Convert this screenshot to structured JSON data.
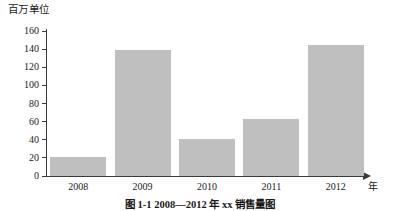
{
  "chart_data": {
    "type": "bar",
    "title": "",
    "categories": [
      "2008",
      "2009",
      "2010",
      "2011",
      "2012"
    ],
    "values": [
      21,
      139,
      41,
      63,
      145
    ],
    "series": [
      {
        "name": "销售量",
        "values": [
          21,
          139,
          41,
          63,
          145
        ]
      }
    ],
    "xlabel": "年",
    "ylabel": "百万单位",
    "ylim": [
      0,
      160
    ],
    "ytick_step": 20,
    "yticks": [
      "160",
      "140",
      "120",
      "100",
      "80",
      "60",
      "40",
      "20",
      "0"
    ],
    "ytick_values": [
      160,
      140,
      120,
      100,
      80,
      60,
      40,
      20,
      0
    ],
    "grid": false,
    "legend": "none",
    "bar_color": "#bfbfbf",
    "axis_color": "#3a3a3a",
    "x_axis_has_arrow": true
  },
  "caption": {
    "text": "图 1-1  2008—2012 年 xx 销售量图"
  }
}
